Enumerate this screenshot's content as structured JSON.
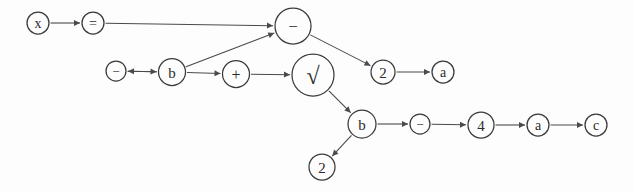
{
  "diagram": {
    "background_color": "#fdfdfd",
    "stroke_color": "#4a4a4a",
    "node_stroke_color": "#3a3a3a",
    "label_color": "#2b2b2b",
    "nodes": [
      {
        "id": "n-x",
        "label": "x",
        "cx": 38,
        "cy": 23,
        "r": 11,
        "font_size": 14,
        "name": "node-x"
      },
      {
        "id": "n-eq",
        "label": "=",
        "cx": 93,
        "cy": 23,
        "r": 11,
        "font_size": 14,
        "name": "node-equals"
      },
      {
        "id": "n-minus1",
        "label": "−",
        "cx": 293,
        "cy": 26,
        "r": 18,
        "font_size": 17,
        "name": "node-minus-main"
      },
      {
        "id": "n-minus2",
        "label": "−",
        "cx": 116,
        "cy": 71,
        "r": 10,
        "font_size": 13,
        "name": "node-minus-small"
      },
      {
        "id": "n-b1",
        "label": "b",
        "cx": 172,
        "cy": 72,
        "r": 13.5,
        "font_size": 15,
        "name": "node-b-upper"
      },
      {
        "id": "n-plus",
        "label": "+",
        "cx": 236,
        "cy": 74,
        "r": 13.5,
        "font_size": 16,
        "name": "node-plus"
      },
      {
        "id": "n-sqrt",
        "label": "√",
        "cx": 313,
        "cy": 75,
        "r": 21,
        "font_size": 24,
        "name": "node-sqrt"
      },
      {
        "id": "n-2a",
        "label": "2",
        "cx": 383,
        "cy": 72,
        "r": 12,
        "font_size": 15,
        "name": "node-two-upper"
      },
      {
        "id": "n-a1",
        "label": "a",
        "cx": 443,
        "cy": 72,
        "r": 11,
        "font_size": 14,
        "name": "node-a-upper"
      },
      {
        "id": "n-b2",
        "label": "b",
        "cx": 362,
        "cy": 124,
        "r": 14,
        "font_size": 15,
        "name": "node-b-lower"
      },
      {
        "id": "n-minus3",
        "label": "−",
        "cx": 420,
        "cy": 124,
        "r": 10,
        "font_size": 13,
        "name": "node-minus-lower"
      },
      {
        "id": "n-4",
        "label": "4",
        "cx": 481,
        "cy": 125,
        "r": 13,
        "font_size": 15,
        "name": "node-four"
      },
      {
        "id": "n-a2",
        "label": "a",
        "cx": 538,
        "cy": 125,
        "r": 11,
        "font_size": 14,
        "name": "node-a-lower"
      },
      {
        "id": "n-c",
        "label": "c",
        "cx": 596,
        "cy": 125,
        "r": 11,
        "font_size": 14,
        "name": "node-c"
      },
      {
        "id": "n-2b",
        "label": "2",
        "cx": 322,
        "cy": 167,
        "r": 13,
        "font_size": 15,
        "name": "node-two-lower"
      }
    ],
    "edges": [
      {
        "from": "n-x",
        "to": "n-eq",
        "name": "edge-x-to-equals"
      },
      {
        "from": "n-eq",
        "to": "n-minus1",
        "name": "edge-equals-to-minus-main"
      },
      {
        "from": "n-b1",
        "to": "n-minus1",
        "name": "edge-b-upper-to-minus-main"
      },
      {
        "from": "n-b1",
        "to": "n-minus2",
        "name": "edge-b-upper-to-minus-small"
      },
      {
        "from": "n-minus2",
        "to": "n-b1",
        "name": "edge-minus-small-to-b-upper"
      },
      {
        "from": "n-b1",
        "to": "n-plus",
        "name": "edge-b-upper-to-plus"
      },
      {
        "from": "n-plus",
        "to": "n-sqrt",
        "name": "edge-plus-to-sqrt"
      },
      {
        "from": "n-minus1",
        "to": "n-2a",
        "name": "edge-minus-main-to-two-upper"
      },
      {
        "from": "n-2a",
        "to": "n-a1",
        "name": "edge-two-upper-to-a-upper"
      },
      {
        "from": "n-sqrt",
        "to": "n-b2",
        "name": "edge-sqrt-to-b-lower"
      },
      {
        "from": "n-b2",
        "to": "n-minus3",
        "name": "edge-b-lower-to-minus-lower"
      },
      {
        "from": "n-minus3",
        "to": "n-4",
        "name": "edge-minus-lower-to-four"
      },
      {
        "from": "n-4",
        "to": "n-a2",
        "name": "edge-four-to-a-lower"
      },
      {
        "from": "n-a2",
        "to": "n-c",
        "name": "edge-a-lower-to-c"
      },
      {
        "from": "n-b2",
        "to": "n-2b",
        "name": "edge-b-lower-to-two-lower"
      }
    ]
  }
}
